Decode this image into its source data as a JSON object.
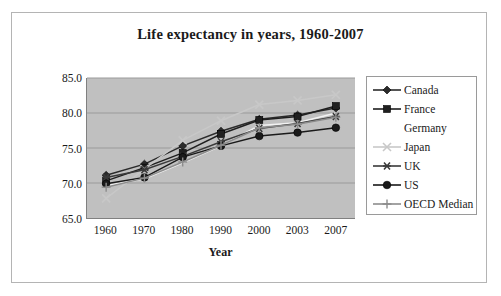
{
  "chart_data": {
    "type": "line",
    "title": "Life expectancy in years, 1960-2007",
    "xlabel": "Year",
    "ylabel": "Life expectancy",
    "categories": [
      "1960",
      "1970",
      "1980",
      "1990",
      "2000",
      "2003",
      "2007"
    ],
    "ylim": [
      65.0,
      85.0
    ],
    "ytick_labels": [
      "85.0",
      "80.0",
      "75.0",
      "70.0",
      "65.0"
    ],
    "ytick_values": [
      85.0,
      80.0,
      75.0,
      70.0,
      65.0
    ],
    "grid": true,
    "legend_position": "right",
    "plot_background": "#c0c0c0",
    "series": [
      {
        "name": "Canada",
        "marker": "diamond",
        "color": "#2b2b2b",
        "values": [
          71.1,
          72.7,
          75.3,
          77.4,
          79.1,
          79.7,
          80.7
        ]
      },
      {
        "name": "France",
        "marker": "square",
        "color": "#1f1f1f",
        "values": [
          70.3,
          72.2,
          74.3,
          77.0,
          79.0,
          79.5,
          81.0
        ]
      },
      {
        "name": "Germany",
        "marker": "none",
        "color": "#f2f2f2",
        "values": [
          69.6,
          70.6,
          72.9,
          75.3,
          78.2,
          78.6,
          80.0
        ]
      },
      {
        "name": "Japan",
        "marker": "x",
        "color": "#c8c8c8",
        "values": [
          67.8,
          72.0,
          76.1,
          78.9,
          81.2,
          81.8,
          82.6
        ]
      },
      {
        "name": "UK",
        "marker": "asterisk",
        "color": "#3a3a3a",
        "values": [
          70.8,
          71.9,
          73.8,
          75.9,
          77.8,
          78.5,
          79.5
        ]
      },
      {
        "name": "US",
        "marker": "circle",
        "color": "#1a1a1a",
        "values": [
          69.9,
          70.8,
          73.7,
          75.3,
          76.7,
          77.2,
          77.9
        ]
      },
      {
        "name": "OECD Median",
        "marker": "plus",
        "color": "#8c8c8c",
        "values": [
          69.4,
          70.7,
          73.0,
          75.4,
          77.9,
          78.4,
          79.4
        ]
      }
    ]
  }
}
